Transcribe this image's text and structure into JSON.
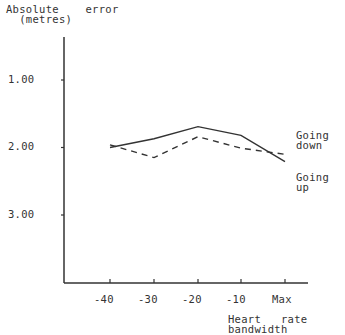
{
  "chart_data": {
    "type": "line",
    "title": "",
    "ylabel": "Absolute error (metres)",
    "ylabel_lines": [
      "Absolute    error",
      "  (metres)"
    ],
    "xlabel": "Heart rate bandwidth",
    "xlabel_lines": [
      "Heart   rate",
      "bandwidth"
    ],
    "categories": [
      "-40",
      "-30",
      "-20",
      "-10",
      "Max"
    ],
    "y_ticks": [
      "1.00",
      "2.00",
      "3.00"
    ],
    "y_tick_values": [
      1.0,
      2.0,
      3.0
    ],
    "ylim": [
      0.37,
      4.0
    ],
    "y_inverted": true,
    "grid": false,
    "legend_position": "right, inline labels",
    "series": [
      {
        "name": "Going down",
        "label_lines": [
          "Going",
          "down"
        ],
        "style": "solid",
        "values": [
          2.0,
          1.87,
          1.69,
          1.82,
          2.21
        ]
      },
      {
        "name": "Going up",
        "label_lines": [
          "Going",
          "up"
        ],
        "style": "dashed",
        "values": [
          1.96,
          2.15,
          1.84,
          2.01,
          2.1
        ]
      }
    ]
  }
}
